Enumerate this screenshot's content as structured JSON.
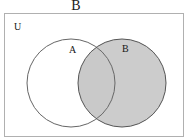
{
  "figure": {
    "title": "B",
    "type": "venn-diagram",
    "universe_label": "U",
    "set_labels": {
      "left": "A",
      "right": "B"
    },
    "shaded_region": "B",
    "colors": {
      "shading": "#cccccc",
      "outline": "#555555",
      "frame": "#b0b0b0",
      "text": "#161616",
      "background": "#ffffff"
    },
    "geometry": {
      "frame": {
        "x": 4,
        "y": 13,
        "width": 180,
        "height": 124
      },
      "circle_a": {
        "cx": 71,
        "cy": 83,
        "r": 44
      },
      "circle_b": {
        "cx": 122,
        "cy": 83,
        "r": 44
      }
    }
  }
}
